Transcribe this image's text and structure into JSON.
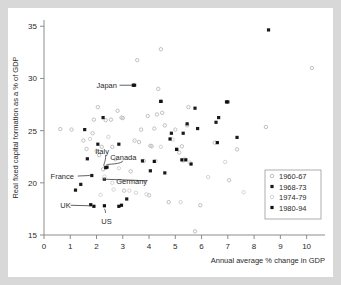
{
  "chart_data": {
    "type": "scatter",
    "title": "",
    "xlabel": "Annual average % change in GDP",
    "ylabel": "Real fixed capital formation as a % of GDP",
    "xlim": [
      0,
      10.7
    ],
    "ylim": [
      15,
      35.6
    ],
    "xticks": [
      0,
      1,
      2,
      3,
      4,
      5,
      6,
      7,
      8,
      9,
      10
    ],
    "xtick_labels": [
      "0",
      "1",
      "2",
      "3",
      "4",
      "5",
      "6",
      "7",
      "8",
      "9",
      "10"
    ],
    "yticks": [
      15,
      20,
      25,
      30,
      35
    ],
    "ytick_labels": [
      "15",
      "20",
      "25",
      "30",
      "35"
    ],
    "grid": false,
    "legend_position": "lower-right",
    "series": [
      {
        "name": "1960-67",
        "marker": "open-circle",
        "color": "#b9b9b9",
        "points": [
          [
            0.62,
            25.15
          ],
          [
            1.05,
            25.1
          ],
          [
            1.5,
            24.05
          ],
          [
            1.62,
            23.25
          ],
          [
            1.85,
            24.75
          ],
          [
            1.9,
            26.05
          ],
          [
            2.05,
            27.25
          ],
          [
            2.1,
            22.65
          ],
          [
            2.2,
            23.45
          ],
          [
            2.25,
            21.3
          ],
          [
            2.35,
            26.0
          ],
          [
            2.55,
            26.05
          ],
          [
            2.6,
            23.45
          ],
          [
            2.72,
            22.25
          ],
          [
            2.8,
            26.9
          ],
          [
            2.95,
            26.25
          ],
          [
            3.0,
            26.2
          ],
          [
            3.05,
            19.25
          ],
          [
            3.3,
            21.1
          ],
          [
            3.45,
            24.05
          ],
          [
            3.55,
            31.75
          ],
          [
            3.62,
            23.9
          ],
          [
            3.7,
            25.1
          ],
          [
            3.8,
            22.1
          ],
          [
            3.95,
            26.4
          ],
          [
            4.0,
            18.8
          ],
          [
            4.05,
            23.55
          ],
          [
            4.1,
            23.5
          ],
          [
            4.2,
            25.2
          ],
          [
            4.3,
            26.55
          ],
          [
            4.35,
            29.0
          ],
          [
            4.45,
            32.8
          ],
          [
            4.5,
            26.7
          ],
          [
            4.6,
            25.5
          ],
          [
            4.75,
            18.15
          ],
          [
            5.0,
            25.1
          ],
          [
            5.15,
            22.9
          ],
          [
            5.25,
            23.5
          ],
          [
            5.3,
            22.15
          ],
          [
            5.45,
            25.5
          ],
          [
            5.5,
            27.25
          ],
          [
            5.75,
            15.35
          ],
          [
            5.95,
            17.85
          ],
          [
            6.5,
            23.85
          ],
          [
            7.05,
            20.25
          ],
          [
            7.35,
            23.2
          ],
          [
            8.45,
            25.35
          ],
          [
            10.2,
            31.0
          ]
        ]
      },
      {
        "name": "1968-73",
        "marker": "filled-square",
        "color": "#1a1a1a",
        "points": [
          [
            1.2,
            19.3
          ],
          [
            1.4,
            19.85
          ],
          [
            1.55,
            25.1
          ],
          [
            1.65,
            22.3
          ],
          [
            1.82,
            20.7
          ],
          [
            2.05,
            23.7
          ],
          [
            2.25,
            26.25
          ],
          [
            2.3,
            20.35
          ],
          [
            2.4,
            21.5
          ],
          [
            2.85,
            23.7
          ],
          [
            3.15,
            18.45
          ],
          [
            3.45,
            29.35
          ],
          [
            3.75,
            22.1
          ],
          [
            4.05,
            21.15
          ],
          [
            4.45,
            27.8
          ],
          [
            4.6,
            20.95
          ],
          [
            4.85,
            24.75
          ],
          [
            5.05,
            23.2
          ],
          [
            5.3,
            24.75
          ],
          [
            5.45,
            25.65
          ],
          [
            5.75,
            27.15
          ],
          [
            5.85,
            25.2
          ],
          [
            6.55,
            25.8
          ],
          [
            6.65,
            26.25
          ],
          [
            7.0,
            27.75
          ],
          [
            7.35,
            24.35
          ],
          [
            8.55,
            34.65
          ]
        ]
      },
      {
        "name": "1974-79",
        "marker": "open-circle",
        "color": "#cfcfcf",
        "points": [
          [
            1.75,
            24.2
          ],
          [
            2.0,
            23.05
          ],
          [
            2.15,
            18.85
          ],
          [
            2.3,
            20.6
          ],
          [
            2.45,
            24.4
          ],
          [
            2.6,
            20.0
          ],
          [
            2.65,
            19.35
          ],
          [
            2.85,
            21.4
          ],
          [
            3.25,
            19.25
          ],
          [
            3.5,
            19.05
          ],
          [
            3.9,
            18.9
          ],
          [
            4.25,
            22.1
          ],
          [
            4.45,
            23.45
          ],
          [
            4.9,
            24.15
          ],
          [
            5.2,
            18.15
          ],
          [
            5.35,
            22.3
          ],
          [
            5.55,
            21.95
          ],
          [
            6.25,
            20.55
          ],
          [
            6.9,
            22.0
          ],
          [
            7.6,
            19.1
          ]
        ]
      },
      {
        "name": "1980-94",
        "marker": "filled-square",
        "color": "#111111",
        "points": [
          [
            1.78,
            17.9
          ],
          [
            1.9,
            17.75
          ],
          [
            2.3,
            17.8
          ],
          [
            2.35,
            21.45
          ],
          [
            2.85,
            17.75
          ],
          [
            2.95,
            17.85
          ],
          [
            3.4,
            29.35
          ],
          [
            4.2,
            22.05
          ],
          [
            4.45,
            27.8
          ],
          [
            4.8,
            24.2
          ],
          [
            5.05,
            23.2
          ],
          [
            5.25,
            22.2
          ],
          [
            5.4,
            22.2
          ],
          [
            5.6,
            21.8
          ],
          [
            6.6,
            23.85
          ],
          [
            6.95,
            27.75
          ]
        ]
      }
    ],
    "annotations": [
      {
        "label": "Japan",
        "label_x": 2.0,
        "label_y": 29.35,
        "point_x": 3.42,
        "point_y": 29.35
      },
      {
        "label": "Italy",
        "label_x": 1.95,
        "label_y": 23.05,
        "point_x": 2.28,
        "point_y": 21.3
      },
      {
        "label": "Canada",
        "label_x": 2.52,
        "label_y": 22.5,
        "point_x": 2.38,
        "point_y": 21.45
      },
      {
        "label": "France",
        "label_x": 0.25,
        "label_y": 20.65,
        "point_x": 1.82,
        "point_y": 20.7
      },
      {
        "label": "Germany",
        "label_x": 2.75,
        "label_y": 20.2,
        "point_x": 2.3,
        "point_y": 20.35
      },
      {
        "label": "UK",
        "label_x": 0.62,
        "label_y": 17.85,
        "point_x": 1.82,
        "point_y": 17.8
      },
      {
        "label": "US",
        "label_x": 2.18,
        "label_y": 16.35,
        "point_x": 2.3,
        "point_y": 17.8
      }
    ]
  }
}
